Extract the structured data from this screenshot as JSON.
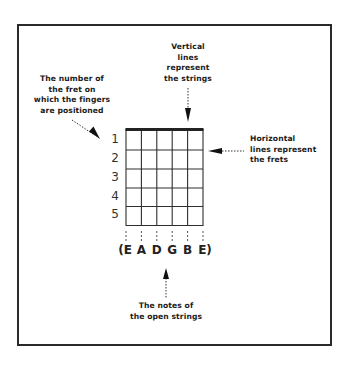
{
  "diagram": {
    "labels": {
      "strings": [
        "Vertical",
        "lines",
        "represent",
        "the strings"
      ],
      "fret_number": [
        "The number of",
        "the fret on",
        "which the fingers",
        "are positioned"
      ],
      "frets": [
        "Horizontal",
        "lines represent",
        "the frets"
      ],
      "open_strings": [
        "The notes of",
        "the open strings"
      ]
    },
    "fret_numbers": [
      "1",
      "2",
      "3",
      "4",
      "5"
    ],
    "open_string_notes": [
      "(E",
      "A",
      "D",
      "G",
      "B",
      "E)"
    ],
    "grid": {
      "strings": 6,
      "frets": 5
    },
    "colors": {
      "line": "#2a2a2a",
      "text": "#1a1a1a",
      "background": "#ffffff"
    }
  }
}
